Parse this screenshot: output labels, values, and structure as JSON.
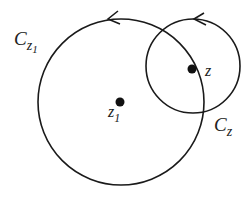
{
  "diagram": {
    "stroke_color": "#1a1a1a",
    "labels": {
      "big_circle": {
        "main": "C",
        "sub": "z",
        "subsub": "1"
      },
      "small_circle": {
        "main": "C",
        "sub": "z"
      },
      "point_z": "z",
      "point_z1": {
        "main": "z",
        "sub": "1"
      }
    },
    "circles": [
      {
        "name": "C_z1",
        "cx": 121,
        "cy": 102,
        "r": 83,
        "orientation": "counterclockwise"
      },
      {
        "name": "C_z",
        "cx": 193,
        "cy": 66,
        "r": 47,
        "orientation": "counterclockwise"
      }
    ],
    "points": [
      {
        "name": "z",
        "x": 192,
        "y": 69
      },
      {
        "name": "z1",
        "x": 120,
        "y": 102
      }
    ]
  }
}
